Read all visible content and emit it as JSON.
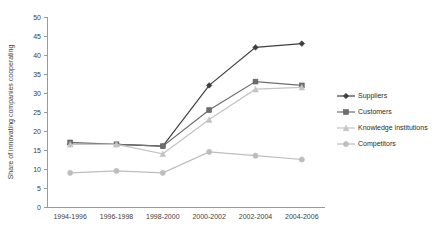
{
  "chart_data": {
    "type": "line",
    "title": "",
    "xlabel": "",
    "ylabel": "Share of innovating companies cooperating",
    "ylim": [
      0,
      50
    ],
    "ytick_step": 5,
    "yticks": [
      "0",
      "5",
      "10",
      "15",
      "20",
      "25",
      "30",
      "35",
      "40",
      "45",
      "50"
    ],
    "grid": false,
    "legend_position": "right",
    "categories": [
      "1994-1996",
      "1996-1998",
      "1998-2000",
      "2000-2002",
      "2002-2004",
      "2004-2006"
    ],
    "series": [
      {
        "name": "Suppliers",
        "color": "#3f3f3f",
        "marker": "diamond",
        "values": [
          16.5,
          16.5,
          16.0,
          32.0,
          42.0,
          43.0
        ]
      },
      {
        "name": "Customers",
        "color": "#6e6e6e",
        "marker": "square",
        "values": [
          17.0,
          16.5,
          16.0,
          25.5,
          33.0,
          32.0
        ]
      },
      {
        "name": "Knowledge institutions",
        "color": "#c4c4c4",
        "marker": "triangle",
        "values": [
          16.5,
          16.5,
          14.0,
          23.0,
          31.0,
          31.5
        ]
      },
      {
        "name": "Competitors",
        "color": "#bdbdbd",
        "marker": "circle",
        "values": [
          9.0,
          9.5,
          9.0,
          14.5,
          13.5,
          12.5
        ]
      }
    ]
  },
  "legend": {
    "entries": [
      {
        "label": "Suppliers"
      },
      {
        "label": "Customers"
      },
      {
        "label": "Knowledge institutions"
      },
      {
        "label": "Competitors"
      }
    ]
  }
}
